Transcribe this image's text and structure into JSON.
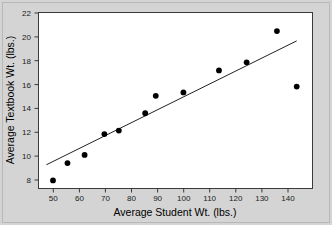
{
  "chart_data": {
    "type": "scatter",
    "title": "",
    "xlabel": "Average Student Wt. (lbs.)",
    "ylabel": "Average Textbook Wt. (lbs.)",
    "xlim": [
      44,
      148
    ],
    "ylim": [
      7.2,
      22.4
    ],
    "xticks": [
      50,
      60,
      70,
      80,
      90,
      100,
      110,
      120,
      130,
      140
    ],
    "yticks": [
      8,
      10,
      12,
      14,
      16,
      18,
      20,
      22
    ],
    "xtick_labels": [
      "50",
      "60",
      "70",
      "80",
      "90",
      "100",
      "110",
      "120",
      "130",
      "140"
    ],
    "ytick_labels": [
      "8",
      "10",
      "12",
      "14",
      "16",
      "18",
      "20",
      "22"
    ],
    "grid": false,
    "legend": null,
    "series": [
      {
        "name": "observations",
        "marker": "filled-circle",
        "color": "#000000",
        "points": [
          {
            "x": 49.5,
            "y": 7.9
          },
          {
            "x": 55.0,
            "y": 9.4
          },
          {
            "x": 61.5,
            "y": 10.1
          },
          {
            "x": 69.0,
            "y": 11.9
          },
          {
            "x": 74.5,
            "y": 12.2
          },
          {
            "x": 84.5,
            "y": 13.7
          },
          {
            "x": 88.5,
            "y": 15.2
          },
          {
            "x": 99.0,
            "y": 15.5
          },
          {
            "x": 112.5,
            "y": 17.4
          },
          {
            "x": 123.0,
            "y": 18.1
          },
          {
            "x": 134.5,
            "y": 20.8
          },
          {
            "x": 142.0,
            "y": 16.0
          }
        ]
      }
    ],
    "trend_line": {
      "name": "least-squares fit",
      "color": "#222222",
      "x_start": 47.0,
      "y_start": 9.25,
      "x_end": 142.0,
      "y_end": 19.95
    }
  }
}
